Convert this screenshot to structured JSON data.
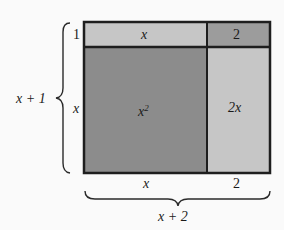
{
  "diagram": {
    "colors": {
      "background": "#fafafa",
      "border": "#1e1e1e",
      "dark_region": "#8c8c8c",
      "light_region": "#c6c6c6",
      "corner_region": "#9c9c9c"
    },
    "regions": {
      "top_left": "x",
      "top_right": "2",
      "bottom_left_base": "x",
      "bottom_left_exp": "2",
      "bottom_right": "2x"
    },
    "side_labels": {
      "row_top": "1",
      "row_bottom": "x",
      "left_total": "x + 1",
      "col_left": "x",
      "col_right": "2",
      "bottom_total": "x + 2"
    }
  }
}
